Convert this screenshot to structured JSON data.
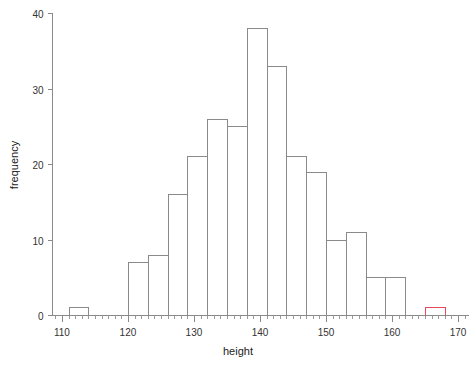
{
  "chart_data": {
    "type": "bar",
    "title": "",
    "subtitle": "",
    "xlabel": "height",
    "ylabel": "frequency",
    "xlim": [
      108.5,
      171.5
    ],
    "ylim": [
      0,
      40
    ],
    "grid": false,
    "legend": "none",
    "bin_width": 3,
    "x_ticks": [
      110,
      120,
      130,
      140,
      150,
      160,
      170
    ],
    "x_tick_labels": [
      "110",
      "120",
      "130",
      "140",
      "150",
      "160",
      "170"
    ],
    "x_minor_tick_step": 1,
    "y_ticks": [
      0,
      10,
      20,
      30,
      40
    ],
    "y_tick_labels": [
      "0",
      "10",
      "20",
      "30",
      "40"
    ],
    "bars": [
      {
        "x0": 111,
        "x1": 114,
        "value": 1,
        "color": "#8a8a8a"
      },
      {
        "x0": 120,
        "x1": 123,
        "value": 7,
        "color": "#8a8a8a"
      },
      {
        "x0": 123,
        "x1": 126,
        "value": 8,
        "color": "#8a8a8a"
      },
      {
        "x0": 126,
        "x1": 129,
        "value": 16,
        "color": "#8a8a8a"
      },
      {
        "x0": 129,
        "x1": 132,
        "value": 21,
        "color": "#8a8a8a"
      },
      {
        "x0": 132,
        "x1": 135,
        "value": 26,
        "color": "#8a8a8a"
      },
      {
        "x0": 135,
        "x1": 138,
        "value": 25,
        "color": "#8a8a8a"
      },
      {
        "x0": 138,
        "x1": 141,
        "value": 38,
        "color": "#8a8a8a"
      },
      {
        "x0": 141,
        "x1": 144,
        "value": 33,
        "color": "#8a8a8a"
      },
      {
        "x0": 144,
        "x1": 147,
        "value": 21,
        "color": "#8a8a8a"
      },
      {
        "x0": 147,
        "x1": 150,
        "value": 19,
        "color": "#8a8a8a"
      },
      {
        "x0": 150,
        "x1": 153,
        "value": 10,
        "color": "#8a8a8a"
      },
      {
        "x0": 153,
        "x1": 156,
        "value": 11,
        "color": "#8a8a8a"
      },
      {
        "x0": 156,
        "x1": 159,
        "value": 5,
        "color": "#8a8a8a"
      },
      {
        "x0": 159,
        "x1": 162,
        "value": 5,
        "color": "#8a8a8a"
      },
      {
        "x0": 165,
        "x1": 168,
        "value": 1,
        "color": "#e8485a"
      }
    ],
    "categories": [
      "111-114",
      "120-123",
      "123-126",
      "126-129",
      "129-132",
      "132-135",
      "135-138",
      "138-141",
      "141-144",
      "144-147",
      "147-150",
      "150-153",
      "153-156",
      "156-159",
      "159-162",
      "165-168"
    ],
    "values": [
      1,
      7,
      8,
      16,
      21,
      26,
      25,
      38,
      33,
      21,
      19,
      10,
      11,
      5,
      5,
      1
    ],
    "colors": {
      "default_bar_stroke": "#8a8a8a",
      "highlight_bar_stroke": "#e8485a",
      "axis": "#8a8a8a",
      "text": "#333333",
      "background": "#ffffff"
    }
  }
}
